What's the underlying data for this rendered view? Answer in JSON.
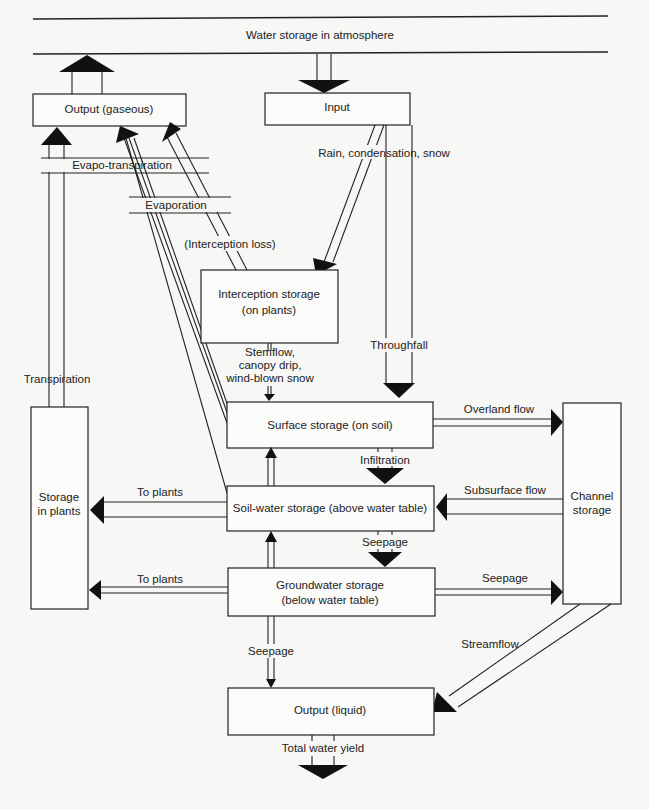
{
  "diagram": {
    "atmosphere": {
      "label": "Water storage in atmosphere"
    },
    "nodes": {
      "output_gaseous": {
        "label": "Output (gaseous)"
      },
      "input": {
        "label": "Input"
      },
      "interception_storage": {
        "line1": "Interception storage",
        "line2": "(on plants)"
      },
      "surface_storage": {
        "label": "Surface storage (on soil)"
      },
      "soil_water_storage": {
        "label": "Soil-water storage (above water table)"
      },
      "groundwater_storage": {
        "line1": "Groundwater storage",
        "line2": "(below water table)"
      },
      "storage_in_plants": {
        "line1": "Storage",
        "line2": "in plants"
      },
      "channel_storage": {
        "line1": "Channel",
        "line2": "storage"
      },
      "output_liquid": {
        "label": "Output (liquid)"
      }
    },
    "flows": {
      "evapo_transpiration": "Evapo-transpiration",
      "evaporation": "Evaporation",
      "interception_loss": "(Interception loss)",
      "rain": "Rain, condensation, snow",
      "transpiration": "Transpiration",
      "stemflow_1": "Stemflow,",
      "stemflow_2": "canopy drip,",
      "stemflow_3": "wind-blown snow",
      "throughfall": "Throughfall",
      "overland_flow": "Overland flow",
      "infiltration": "Infiltration",
      "subsurface_flow": "Subsurface flow",
      "to_plants_1": "To plants",
      "to_plants_2": "To plants",
      "seepage_1": "Seepage",
      "seepage_2": "Seepage",
      "seepage_3": "Seepage",
      "streamflow": "Streamflow",
      "total_water_yield": "Total water yield"
    }
  }
}
